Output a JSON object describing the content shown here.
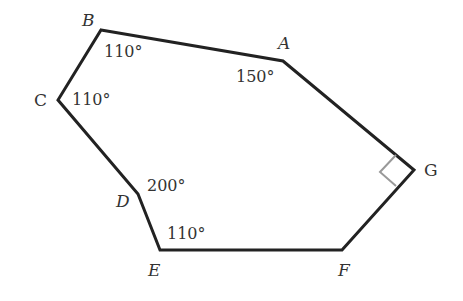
{
  "diagram": {
    "type": "polygon",
    "title": "",
    "colors": {
      "edge": "#222222",
      "right_angle_marker": "#999999",
      "text": "#333333"
    },
    "vertices": [
      {
        "name": "A",
        "x": 283,
        "y": 61
      },
      {
        "name": "B",
        "x": 101,
        "y": 30
      },
      {
        "name": "C",
        "x": 58,
        "y": 100
      },
      {
        "name": "D",
        "x": 138,
        "y": 194
      },
      {
        "name": "E",
        "x": 160,
        "y": 250
      },
      {
        "name": "F",
        "x": 342,
        "y": 250
      },
      {
        "name": "G",
        "x": 414,
        "y": 170
      }
    ],
    "labels": {
      "A": "A",
      "B": "B",
      "C": "C",
      "D": "D",
      "E": "E",
      "F": "F",
      "G": "G"
    },
    "angles": {
      "A": "150°",
      "B": "110°",
      "C": "110°",
      "D": "200°",
      "E": "110°",
      "G": "right angle"
    }
  }
}
